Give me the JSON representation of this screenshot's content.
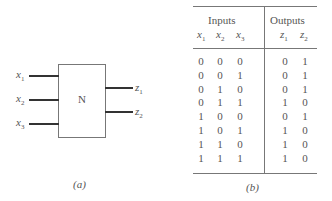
{
  "diagram": {
    "block_label": "N",
    "inputs": [
      {
        "var": "x",
        "sub": "1"
      },
      {
        "var": "x",
        "sub": "2"
      },
      {
        "var": "x",
        "sub": "3"
      }
    ],
    "outputs": [
      {
        "var": "z",
        "sub": "1"
      },
      {
        "var": "z",
        "sub": "2"
      }
    ],
    "caption": "(a)"
  },
  "table": {
    "group_headers": [
      "Inputs",
      "Outputs"
    ],
    "columns": [
      {
        "var": "x",
        "sub": "1"
      },
      {
        "var": "x",
        "sub": "2"
      },
      {
        "var": "x",
        "sub": "3"
      },
      {
        "var": "z",
        "sub": "1"
      },
      {
        "var": "z",
        "sub": "2"
      }
    ],
    "rows": [
      [
        "0",
        "0",
        "0",
        "0",
        "1"
      ],
      [
        "0",
        "0",
        "1",
        "0",
        "1"
      ],
      [
        "0",
        "1",
        "0",
        "0",
        "1"
      ],
      [
        "0",
        "1",
        "1",
        "1",
        "0"
      ],
      [
        "1",
        "0",
        "0",
        "0",
        "1"
      ],
      [
        "1",
        "0",
        "1",
        "1",
        "0"
      ],
      [
        "1",
        "1",
        "0",
        "1",
        "0"
      ],
      [
        "1",
        "1",
        "1",
        "1",
        "0"
      ]
    ],
    "caption": "(b)"
  }
}
